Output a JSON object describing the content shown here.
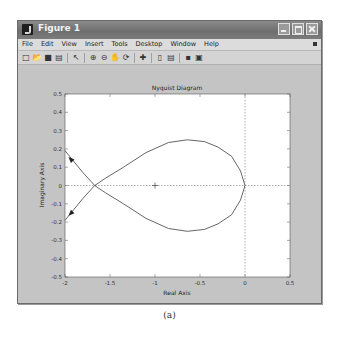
{
  "window": {
    "title": "Figure 1",
    "controls": [
      "minimize",
      "maximize",
      "close"
    ]
  },
  "menubar": {
    "items": [
      "File",
      "Edit",
      "View",
      "Insert",
      "Tools",
      "Desktop",
      "Window",
      "Help"
    ]
  },
  "toolbar": {
    "icons": [
      "new-figure-icon",
      "open-file-icon",
      "save-icon",
      "print-icon",
      "edit-plot-arrow-icon",
      "zoom-in-icon",
      "zoom-out-icon",
      "pan-hand-icon",
      "rotate-3d-icon",
      "data-cursor-icon",
      "insert-colorbar-icon",
      "insert-legend-icon",
      "hide-plot-tools-icon",
      "show-plot-tools-icon"
    ]
  },
  "caption": "(a)",
  "colors": {
    "curve": "#555555",
    "figure_bg": "#c4c4c4",
    "axes_bg": "#ffffff"
  },
  "chart_data": {
    "type": "line",
    "title": "Nyquist Diagram",
    "xlabel": "Real Axis",
    "ylabel": "Imaginary Axis",
    "xlim": [
      -2,
      0.5
    ],
    "ylim": [
      -0.5,
      0.5
    ],
    "xticks": [
      -2,
      -1.5,
      -1,
      -0.5,
      0,
      0.5
    ],
    "xtick_labels": [
      "-2",
      "-1.5",
      "-1",
      "-0.5",
      "0",
      "0.5"
    ],
    "yticks": [
      0.5,
      0.4,
      0.3,
      0.2,
      0.1,
      0,
      -0.1,
      -0.2,
      -0.3,
      -0.4,
      -0.5
    ],
    "ytick_labels": [
      "0.5",
      "0.4",
      "0.3",
      "0.2",
      "0.1",
      "0",
      "-0.1",
      "-0.2",
      "-0.3",
      "-0.4",
      "-0.5"
    ],
    "grid": false,
    "reference_lines": {
      "x0_dotted": true,
      "y0_dotted": true
    },
    "critical_point": {
      "x": -1,
      "y": 0,
      "marker": "+"
    },
    "series": [
      {
        "name": "positive frequencies",
        "x": [
          0,
          -0.05,
          -0.15,
          -0.3,
          -0.45,
          -0.64,
          -0.85,
          -1.1,
          -1.35,
          -1.55,
          -1.67,
          -1.8,
          -1.95,
          -2.0
        ],
        "y": [
          0,
          -0.08,
          -0.16,
          -0.21,
          -0.24,
          -0.25,
          -0.235,
          -0.18,
          -0.1,
          -0.04,
          0,
          0.07,
          0.16,
          0.19
        ]
      },
      {
        "name": "negative frequencies",
        "x": [
          0,
          -0.05,
          -0.15,
          -0.3,
          -0.45,
          -0.64,
          -0.85,
          -1.1,
          -1.35,
          -1.55,
          -1.67,
          -1.8,
          -1.95,
          -2.0
        ],
        "y": [
          0,
          0.08,
          0.16,
          0.21,
          0.24,
          0.25,
          0.235,
          0.18,
          0.1,
          0.04,
          0,
          -0.07,
          -0.16,
          -0.19
        ]
      }
    ],
    "arrows": [
      {
        "x": -1.93,
        "y": 0.14,
        "direction": "up-left"
      },
      {
        "x": -1.93,
        "y": -0.15,
        "direction": "down-left"
      }
    ]
  }
}
